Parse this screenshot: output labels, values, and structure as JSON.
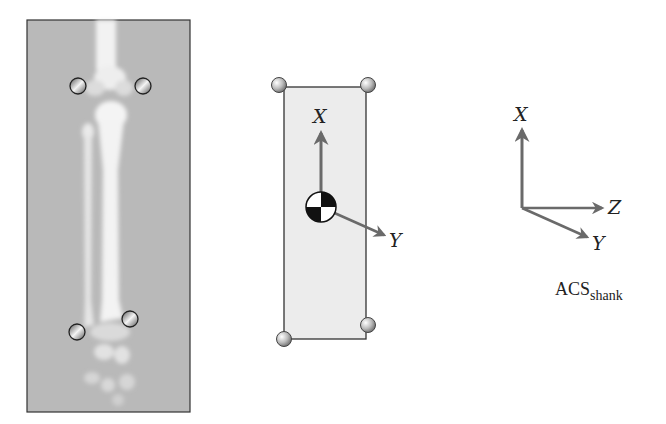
{
  "figure": {
    "type": "biomechanics-coordinate-system-diagram",
    "panels": [
      {
        "id": "xray",
        "description": "Shank X-ray with four tracking markers"
      },
      {
        "id": "segment",
        "description": "Rectangular shank segment model with center-of-mass marker and local axes"
      },
      {
        "id": "acs",
        "description": "Anatomical coordinate system axes"
      }
    ]
  },
  "segment": {
    "axis_x_label": "X",
    "axis_y_label": "Y"
  },
  "acs": {
    "axis_x_label": "X",
    "axis_y_label": "Y",
    "axis_z_label": "Z",
    "caption_main": "ACS",
    "caption_sub": "shank"
  },
  "colors": {
    "xray_bg": "#b8b8b8",
    "bone": "#f0f0f0",
    "segment_fill": "#ececec",
    "axis_arrow": "#6a6a6a",
    "outline": "#333333"
  }
}
